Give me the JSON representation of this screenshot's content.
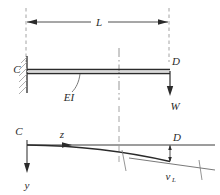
{
  "figure": {
    "type": "engineering-diagram",
    "colors": {
      "line": "#3a3a3a",
      "beam": "#2b2b2b",
      "dashed": "#8a8a8a",
      "hatch": "#9a9a9a",
      "background": "#ffffff"
    }
  },
  "upper_diagram": {
    "name": "beam-free-body-diagram",
    "dimension": {
      "label": "L",
      "description": "overall span from fixed support C to free end D"
    },
    "support": {
      "label": "C",
      "kind": "fixed-support",
      "hatching": true
    },
    "free_end": {
      "label": "D",
      "kind": "free-end"
    },
    "beam": {
      "label": "EI",
      "description": "uniform flexural rigidity"
    },
    "load": {
      "label": "W",
      "direction": "downward",
      "location": "free end D"
    },
    "centerline": {
      "label": "",
      "kind": "dash-dot-centerline"
    }
  },
  "lower_diagram": {
    "name": "deflection-diagram",
    "origin_label": "C",
    "axis_z": {
      "label": "z",
      "direction": "right"
    },
    "axis_y": {
      "label": "y",
      "direction": "down"
    },
    "end_label": "D",
    "deflection": {
      "label": "v",
      "subscript": "L",
      "description": "tip deflection at z = L"
    }
  }
}
